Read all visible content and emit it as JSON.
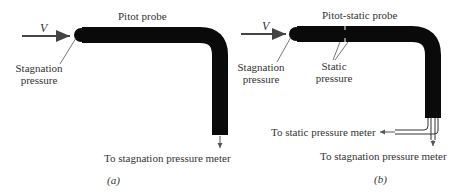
{
  "panel_a": {
    "title": "Pitot probe",
    "velocity_symbol": "V",
    "stagnation_label_line1": "Stagnation",
    "stagnation_label_line2": "pressure",
    "meter_label": "To stagnation pressure meter",
    "caption": "(a)"
  },
  "panel_b": {
    "title": "Pitot-static probe",
    "velocity_symbol": "V",
    "stagnation_label_line1": "Stagnation",
    "stagnation_label_line2": "pressure",
    "static_label_line1": "Static",
    "static_label_line2": "pressure",
    "static_meter_label": "To static pressure meter",
    "stagnation_meter_label": "To stagnation pressure meter",
    "caption": "(b)"
  },
  "colors": {
    "probe": "#0a0a0a",
    "text": "#333333",
    "arrow": "#444444"
  }
}
